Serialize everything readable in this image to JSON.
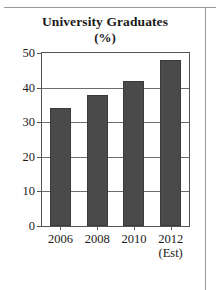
{
  "chart_data": {
    "type": "bar",
    "title": "University Graduates",
    "subtitle": "(%)",
    "xlabel": "",
    "ylabel": "",
    "categories": [
      "2006",
      "2008",
      "2010",
      "2012"
    ],
    "category_sublabels": [
      "",
      "",
      "",
      "(Est)"
    ],
    "values": [
      34,
      38,
      42,
      48
    ],
    "ylim": [
      0,
      50
    ],
    "yticks": [
      0,
      10,
      20,
      30,
      40,
      50
    ],
    "ytick_labels": [
      "0",
      "10",
      "20",
      "30",
      "40",
      "50"
    ],
    "grid": true,
    "legend": "none",
    "bar_color": "#4a4a4a",
    "axis_color": "#555555",
    "grid_color": "#6d6d6d",
    "background": "#ffffff"
  }
}
